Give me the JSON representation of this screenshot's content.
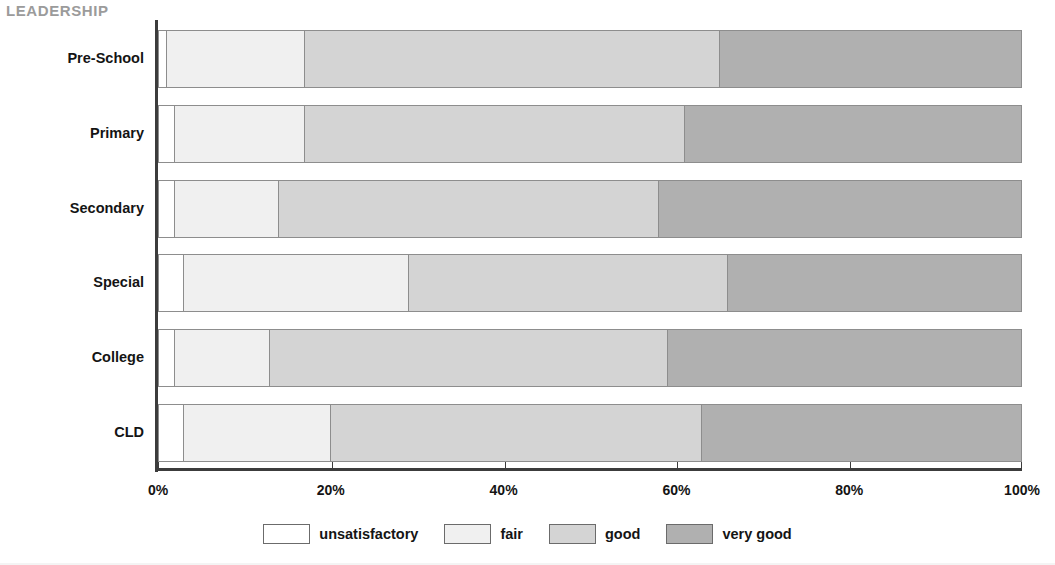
{
  "title": "LEADERSHIP",
  "title_color": "#9b9b9b",
  "chart_data": {
    "type": "bar",
    "orientation": "horizontal",
    "stacked": true,
    "normalized_percent": true,
    "title": "LEADERSHIP",
    "xlabel": "",
    "ylabel": "",
    "xlim": [
      0,
      100
    ],
    "grid": false,
    "legend_position": "bottom",
    "categories": [
      "Pre-School",
      "Primary",
      "Secondary",
      "Special",
      "College",
      "CLD"
    ],
    "series": [
      {
        "name": "unsatisfactory",
        "color": "#ffffff",
        "values": [
          1,
          2,
          2,
          3,
          2,
          3
        ]
      },
      {
        "name": "fair",
        "color": "#f0f0f0",
        "values": [
          16,
          15,
          12,
          26,
          11,
          17
        ]
      },
      {
        "name": "good",
        "color": "#d4d4d4",
        "values": [
          48,
          44,
          44,
          37,
          46,
          43
        ]
      },
      {
        "name": "very good",
        "color": "#b0b0b0",
        "values": [
          35,
          39,
          42,
          34,
          41,
          37
        ]
      }
    ],
    "cumulative_boundaries_percent": {
      "Pre-School": [
        1,
        17,
        65,
        100
      ],
      "Primary": [
        2,
        17,
        61,
        100
      ],
      "Secondary": [
        2,
        14,
        58,
        100
      ],
      "Special": [
        3,
        29,
        66,
        100
      ],
      "College": [
        2,
        13,
        59,
        100
      ],
      "CLD": [
        3,
        20,
        63,
        100
      ]
    },
    "xticks": [
      0,
      20,
      40,
      60,
      80,
      100
    ],
    "xtick_labels": [
      "0%",
      "20%",
      "40%",
      "60%",
      "80%",
      "100%"
    ]
  },
  "legend": {
    "items": [
      {
        "label": "unsatisfactory",
        "color": "#ffffff"
      },
      {
        "label": "fair",
        "color": "#f0f0f0"
      },
      {
        "label": "good",
        "color": "#d4d4d4"
      },
      {
        "label": "very good",
        "color": "#b0b0b0"
      }
    ]
  }
}
